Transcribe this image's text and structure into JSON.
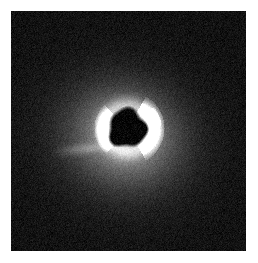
{
  "figure": {
    "kind": "astronomical-image",
    "canvas": {
      "width": 258,
      "height": 263,
      "background": "#ffffff"
    },
    "plate": {
      "x": 11,
      "y": 11,
      "width": 235,
      "height": 240,
      "background_color": "#0b0b0b",
      "border_color": "#ffffff"
    }
  },
  "chart_data": {
    "type": "heatmap",
    "subtitle": "",
    "xlabel": "",
    "ylabel": "",
    "colormap": "grayscale",
    "grid": false,
    "legend": "none",
    "axis_ticks_visible": false,
    "xlim": [
      0,
      235
    ],
    "ylim": [
      0,
      240
    ],
    "value_range": [
      0,
      255
    ],
    "background_level": 18,
    "noise_sigma": 13,
    "features": [
      {
        "name": "occulted-dark-core",
        "shape": "disk",
        "cx": 116,
        "cy": 117,
        "radius": 17,
        "level": 6,
        "edge_softness": 4,
        "note": "dark absorbed/occulted nucleus, slightly irregular lobed outline"
      },
      {
        "name": "bright-inner-ring",
        "shape": "annulus",
        "cx": 116,
        "cy": 117,
        "inner_radius": 17,
        "outer_radius": 30,
        "level": 150,
        "note": "bright rim encircling the dark core"
      },
      {
        "name": "bright-arc-lower-right",
        "shape": "arc",
        "cx": 116,
        "cy": 117,
        "radius": 26,
        "angle_start_deg": 300,
        "angle_end_deg": 60,
        "thickness": 11,
        "level": 225,
        "note": "brightest curved knot / spiral filament lower-right of core"
      },
      {
        "name": "bright-arc-upper-right",
        "shape": "arc",
        "cx": 116,
        "cy": 117,
        "radius": 27,
        "angle_start_deg": 320,
        "angle_end_deg": 355,
        "thickness": 7,
        "level": 175,
        "note": "short bright arc at upper-right"
      },
      {
        "name": "bright-arc-left",
        "shape": "arc",
        "cx": 116,
        "cy": 117,
        "radius": 25,
        "angle_start_deg": 130,
        "angle_end_deg": 225,
        "thickness": 8,
        "level": 185,
        "note": "bright arc sweeping the left and lower-left of the core"
      },
      {
        "name": "diffuse-halo",
        "shape": "ellipse-gaussian",
        "cx": 114,
        "cy": 124,
        "semi_major": 66,
        "semi_minor": 58,
        "rotation_deg": 15,
        "peak_level": 110,
        "note": "broad diffuse glow, brightest just below the core, fading into noise"
      },
      {
        "name": "faint-outer-envelope",
        "shape": "ellipse-gaussian",
        "cx": 112,
        "cy": 128,
        "semi_major": 100,
        "semi_minor": 88,
        "rotation_deg": 20,
        "peak_level": 44,
        "note": "very faint extended envelope reaching toward the plate edges"
      },
      {
        "name": "faint-west-streak",
        "shape": "streak",
        "x0": 40,
        "y0": 141,
        "x1": 104,
        "y1": 134,
        "thickness": 6,
        "level": 48,
        "note": "faint horizontal wisp extending to the left of the nucleus"
      }
    ]
  }
}
